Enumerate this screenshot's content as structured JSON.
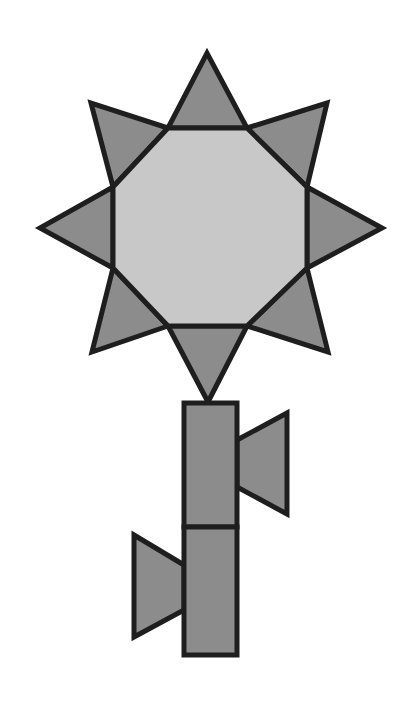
{
  "figure": {
    "width": 409,
    "height": 704,
    "colors": {
      "background": "#ffffff",
      "outline": "#1e1e1e",
      "center_fill": "#c8c8c8",
      "petal_fill": "#8c8c8c",
      "stem_fill": "#8c8c8c",
      "leaf_fill": "#8c8c8c"
    },
    "stroke_width": 5,
    "flower_head": {
      "center": {
        "shape": "octagon",
        "points": "168,128 247,128 307,187 307,268 247,326 168,326 113,268 113,187"
      },
      "petals": [
        {
          "name": "petal-top",
          "points": "168,128 207,53 247,128"
        },
        {
          "name": "petal-top-right",
          "points": "247,128 327,103 307,187"
        },
        {
          "name": "petal-right",
          "points": "307,187 382,228 307,268"
        },
        {
          "name": "petal-bottom-right",
          "points": "307,268 328,352 247,326"
        },
        {
          "name": "petal-bottom",
          "points": "247,326 208,402 168,326"
        },
        {
          "name": "petal-bottom-left",
          "points": "168,326 92,352 113,268"
        },
        {
          "name": "petal-left",
          "points": "113,268 40,228 113,187"
        },
        {
          "name": "petal-top-left",
          "points": "113,187 91,103 168,128"
        }
      ]
    },
    "stem": {
      "segments": [
        {
          "name": "stem-upper-segment",
          "x": 184,
          "y": 403,
          "w": 53,
          "h": 124
        },
        {
          "name": "stem-lower-segment",
          "x": 184,
          "y": 527,
          "w": 53,
          "h": 128
        }
      ]
    },
    "leaves": [
      {
        "name": "leaf-right",
        "points": "237,440 287,413 287,514 237,487"
      },
      {
        "name": "leaf-left",
        "points": "184,565 134,535 134,637 184,610"
      }
    ]
  }
}
